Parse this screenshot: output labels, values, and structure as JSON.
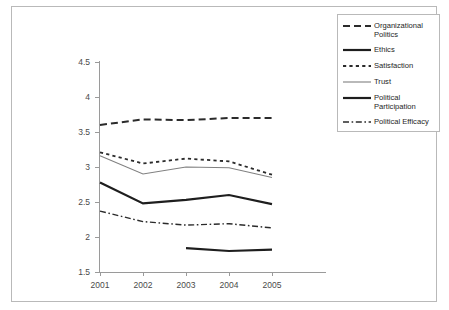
{
  "chart_data": {
    "type": "line",
    "title": "",
    "subtitle": "",
    "xlabel": "",
    "ylabel": "",
    "categories": [
      "2001",
      "2002",
      "2003",
      "2004",
      "2005"
    ],
    "x_tick_labels": [
      "2001",
      "2002",
      "2003",
      "2004",
      "2005"
    ],
    "y_tick_labels": [
      "1.5",
      "2",
      "2.5",
      "3",
      "3.5",
      "4",
      "4.5"
    ],
    "y_tick_values": [
      1.5,
      2,
      2.5,
      3,
      3.5,
      4,
      4.5
    ],
    "ylim": [
      1.5,
      4.5
    ],
    "xlim": [
      "2001",
      "2005"
    ],
    "grid": false,
    "legend_position": "right-top",
    "series": [
      {
        "name": "Organizational Politics",
        "legend_label": "Organizational Politics",
        "style": "dashed",
        "color": "#2b2b2b",
        "width": 2.0,
        "values": [
          3.6,
          3.68,
          3.67,
          3.7,
          3.7
        ]
      },
      {
        "name": "Ethics",
        "legend_label": "Ethics",
        "style": "solid",
        "color": "#1e1e1e",
        "width": 2.2,
        "values": [
          2.78,
          2.48,
          2.53,
          2.6,
          2.47
        ]
      },
      {
        "name": "Satisfaction",
        "legend_label": "Satisfaction",
        "style": "dotted",
        "color": "#2b2b2b",
        "width": 1.8,
        "values": [
          3.21,
          3.05,
          3.12,
          3.08,
          2.89
        ]
      },
      {
        "name": "Trust",
        "legend_label": "Trust",
        "style": "solid-thin",
        "color": "#808080",
        "width": 1.1,
        "values": [
          3.16,
          2.9,
          3.0,
          2.99,
          2.85
        ]
      },
      {
        "name": "Political Participation",
        "legend_label": "Political Participation",
        "style": "solid",
        "color": "#1e1e1e",
        "width": 2.2,
        "values": [
          null,
          null,
          1.84,
          1.8,
          1.82
        ]
      },
      {
        "name": "Political Efficacy",
        "legend_label": "Political Efficacy",
        "style": "dashdot",
        "color": "#2b2b2b",
        "width": 1.4,
        "values": [
          2.37,
          2.22,
          2.17,
          2.19,
          2.13
        ]
      }
    ]
  },
  "legend": {
    "items": [
      {
        "label": "Organizational Politics",
        "style": "dashed"
      },
      {
        "label": "Ethics",
        "style": "solid"
      },
      {
        "label": "Satisfaction",
        "style": "dotted"
      },
      {
        "label": "Trust",
        "style": "solid-thin"
      },
      {
        "label": "Political Participation",
        "style": "solid"
      },
      {
        "label": "Political Efficacy",
        "style": "dashdot"
      }
    ]
  },
  "colors": {
    "axis": "#9a9a9a",
    "border": "#b9b9b9",
    "ink": "#1e1e1e",
    "trust": "#808080",
    "background": "#ffffff"
  }
}
